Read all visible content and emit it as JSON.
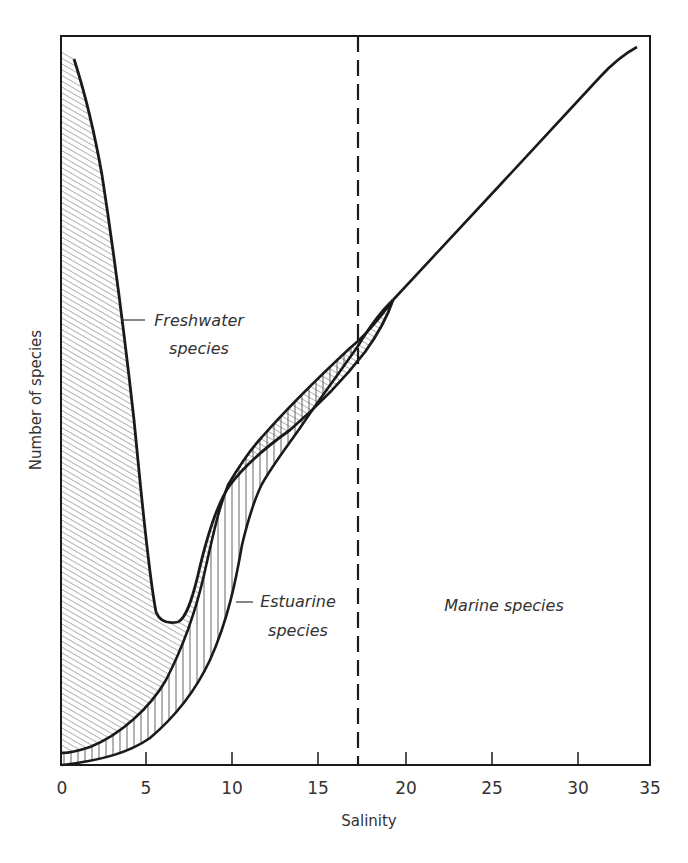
{
  "chart_data": {
    "type": "line",
    "title": "",
    "xlabel": "Salinity",
    "ylabel": "Number of species",
    "xlim": [
      0,
      35
    ],
    "ylim": [
      0,
      100
    ],
    "x_ticks": [
      0,
      5,
      10,
      15,
      20,
      25,
      30,
      35
    ],
    "y_ticks": [],
    "grid": false,
    "legend": "none",
    "y_units": "relative (no numeric scale shown)",
    "reference_lines": [
      {
        "orientation": "vertical",
        "x": 17.5,
        "style": "dashed",
        "label": ""
      }
    ],
    "series": [
      {
        "name": "Freshwater species",
        "fill": "diagonal hatching",
        "note": "Upper boundary of freshwater region; region filled between this curve and the upper estuarine boundary",
        "x": [
          0.6,
          2.2,
          3.4,
          4.6,
          5.4,
          6.0,
          7.0,
          7.6,
          8.5,
          9.3,
          10.5,
          12.0,
          15.0,
          17.5,
          19.5
        ],
        "values": [
          97,
          81,
          61,
          40,
          24,
          19,
          19,
          24,
          34,
          41,
          44,
          47,
          56,
          62,
          67
        ]
      },
      {
        "name": "Estuarine species",
        "fill": "vertical hatching",
        "note": "Band between the upper (freshwater/estuarine boundary) and lower estuarine curves",
        "upper_x": [
          0,
          2.2,
          4.5,
          6.3,
          7.5,
          8.5,
          9.5,
          10.5,
          12.0,
          15.0,
          17.5,
          19.5
        ],
        "upper_values": [
          2,
          3,
          6,
          10,
          14,
          19,
          30,
          40,
          45,
          55,
          61,
          67
        ],
        "lower_x": [
          0,
          1.6,
          3.4,
          5.2,
          7.0,
          8.7,
          9.5,
          10.3,
          11.3,
          12.5,
          15.0,
          17.5,
          19.5
        ],
        "lower_values": [
          0,
          0.5,
          1.5,
          3,
          7,
          12,
          16,
          23,
          30,
          37,
          47,
          57,
          67
        ]
      },
      {
        "name": "Marine species",
        "note": "Single line from convergence point rising to upper right",
        "x": [
          19.5,
          22.0,
          25.0,
          28.0,
          31.0,
          32.5,
          34.3
        ],
        "values": [
          67,
          75,
          83,
          91,
          99,
          102,
          104
        ]
      }
    ],
    "annotations": [
      {
        "text": "Freshwater species",
        "x": 5.5,
        "y": 60,
        "leader": true
      },
      {
        "text": "Estuarine species",
        "x": 11.5,
        "y": 22,
        "leader": true
      },
      {
        "text": "Marine species",
        "x": 25,
        "y": 22,
        "leader": false
      }
    ]
  },
  "labels": {
    "x_axis_title": "Salinity",
    "y_axis_title": "Number of species",
    "x_ticks": [
      "0",
      "5",
      "10",
      "15",
      "20",
      "25",
      "30",
      "35"
    ],
    "freshwater_line1": "Freshwater",
    "freshwater_line2": "species",
    "estuarine_line1": "Estuarine",
    "estuarine_line2": "species",
    "marine": "Marine species"
  },
  "style": {
    "line_color": "#1a1a1a",
    "hatch_color": "#555555",
    "text_color": "#333333",
    "background": "#ffffff"
  },
  "render": {
    "frame": {
      "x": 61,
      "y": 36,
      "w": 589,
      "h": 729
    },
    "x_tick_px": [
      62,
      146,
      232,
      318,
      406,
      492,
      578,
      650
    ],
    "dashed_x_px": 358,
    "freshwater_region_path": "M62,48 L74,59 C84,90 94,130 102,175 C112,240 124,330 134,420 C142,500 148,570 156,612 C160,622 168,624 178,622 C186,618 192,600 198,575 C206,540 216,505 230,485 C244,466 262,450 290,430 C320,404 345,378 365,352 C378,334 387,318 393,300 C380,318 366,335 350,348 C320,376 290,405 262,437 C248,452 238,468 228,485 C218,510 212,540 204,575 C196,610 184,645 166,680 C150,708 120,735 90,747 C78,751 68,753 62,753 Z",
    "estuarine_region_path": "M62,753 C68,753 78,751 90,747 C120,735 150,708 166,680 C184,645 196,610 204,575 C212,540 218,510 228,485 C238,468 248,452 262,437 C290,405 320,376 350,348 C366,335 380,318 393,300 C380,312 370,326 358,346 C340,372 320,398 300,428 C286,448 272,466 262,484 C254,500 248,520 242,545 C236,580 228,620 210,660 C196,690 176,716 150,738 C130,752 104,760 62,765 Z",
    "freshwater_curve": "M74,59 C84,90 94,130 102,175 C112,240 124,330 134,420 C142,500 148,570 156,612 C160,622 168,624 178,622 C186,618 192,600 198,575 C206,540 216,505 230,485 C244,466 262,450 290,430 C320,404 345,378 365,352 C378,334 387,318 393,300",
    "estuarine_upper_curve": "M62,753 C68,753 78,751 90,747 C120,735 150,708 166,680 C184,645 196,610 204,575 C212,540 218,510 228,485 C238,468 248,452 262,437 C290,405 320,376 350,348 C366,335 380,318 393,300",
    "estuarine_lower_curve": "M62,765 C104,760 130,752 150,738 C176,716 196,690 210,660 C228,620 236,580 242,545 C248,520 254,500 262,484 C272,466 286,448 300,428 C320,398 340,372 358,346 C370,326 380,312 393,300",
    "marine_curve": "M393,300 L500,185 L600,77 C612,64 624,54 637,47"
  }
}
